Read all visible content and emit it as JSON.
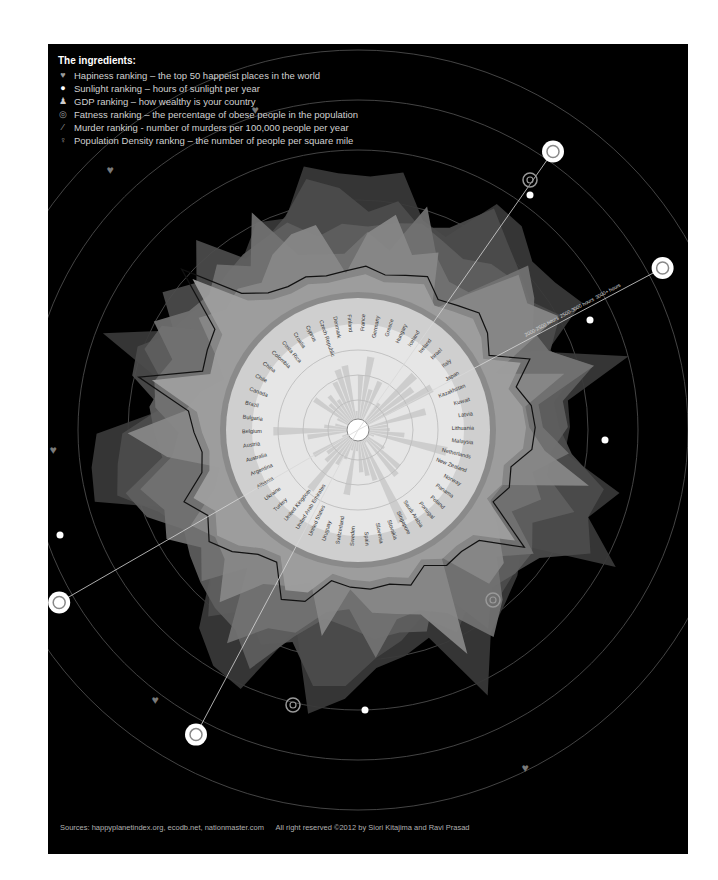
{
  "legend": {
    "title": "The ingredients:",
    "items": [
      {
        "icon": "heart-icon",
        "label": "Hapiness ranking – the top 50 happeist places in the world"
      },
      {
        "icon": "sun-icon",
        "label": "Sunlight ranking – hours of sunlight per year"
      },
      {
        "icon": "money-bag-icon",
        "label": "GDP  ranking – how wealthy is your country"
      },
      {
        "icon": "target-rings-icon",
        "label": "Fatness ranking – the percentage of obese people in the population"
      },
      {
        "icon": "knife-icon",
        "label": "Murder ranking - number of murders per 100,000 people per year"
      },
      {
        "icon": "person-icon",
        "label": "Population Density rankng – the number of people per square mile"
      }
    ]
  },
  "footer": {
    "sources": "Sources: happyplanetindex.org, ecodb.net, nationmaster.com",
    "rights": "All right reserved ©2012 by Siori Kitajima and Ravi Prasad"
  },
  "colors": {
    "background": "#000000",
    "inner_disc": "#e6e6e6",
    "label_ring": "#cfcfcf",
    "layer_light": "#9a9a9a",
    "layer_mid": "#6e6e6e",
    "layer_dark": "#3f3f3f",
    "guide_line": "#d8d8d8"
  },
  "chart_data": {
    "type": "radial",
    "title": "The ingredients",
    "categories": [
      "Canada",
      "Chile",
      "China",
      "Colombia",
      "Costa Rica",
      "Croatia",
      "Cyprus",
      "Czech Republic",
      "Denmark",
      "Finland",
      "France",
      "Germany",
      "Greece",
      "Hungary",
      "Iceland",
      "Ireland",
      "Israel",
      "Italy",
      "Japan",
      "Kazakhstan",
      "Kuwait",
      "Latvia",
      "Lithuania",
      "Malaysia",
      "Netherlands",
      "New Zealand",
      "Norway",
      "Panama",
      "Poland",
      "Portugal",
      "Saudi Arabia",
      "Singapore",
      "Slovakia",
      "Slovenia",
      "Spain",
      "Sweden",
      "Switzerland",
      "Uruguay",
      "United States",
      "United Arab Emirates",
      "United Kingdom",
      "Turkey",
      "Ukraine",
      "Albania",
      "Argentina",
      "Australia",
      "Austria",
      "Belgium",
      "Bulgaria",
      "Brazil"
    ],
    "series": [
      {
        "name": "Hapiness ranking",
        "values": [
          58,
          42,
          60,
          48,
          66,
          40,
          44,
          52,
          70,
          62,
          48,
          56,
          44,
          50,
          72,
          60,
          52,
          46,
          56,
          42,
          54,
          36,
          38,
          46,
          68,
          64,
          74,
          50,
          44,
          48,
          40,
          52,
          36,
          46,
          54,
          70,
          72,
          50,
          58,
          44,
          60,
          40,
          34,
          38,
          46,
          66,
          62,
          58,
          36,
          56
        ]
      },
      {
        "name": "Sunlight ranking",
        "values": [
          46,
          70,
          52,
          48,
          60,
          44,
          78,
          36,
          32,
          30,
          46,
          34,
          72,
          40,
          28,
          30,
          74,
          62,
          48,
          52,
          80,
          34,
          36,
          56,
          32,
          44,
          28,
          58,
          38,
          64,
          82,
          50,
          40,
          42,
          68,
          32,
          36,
          56,
          60,
          84,
          30,
          60,
          44,
          62,
          54,
          66,
          38,
          32,
          50,
          54
        ]
      },
      {
        "name": "GDP ranking",
        "values": [
          72,
          40,
          36,
          30,
          34,
          38,
          50,
          46,
          70,
          64,
          62,
          66,
          44,
          40,
          68,
          66,
          56,
          58,
          64,
          36,
          76,
          40,
          40,
          38,
          70,
          58,
          82,
          34,
          42,
          48,
          56,
          84,
          44,
          50,
          54,
          70,
          80,
          38,
          78,
          74,
          62,
          36,
          26,
          24,
          36,
          72,
          70,
          66,
          30,
          34
        ]
      },
      {
        "name": "Fatness ranking",
        "values": [
          60,
          56,
          22,
          40,
          44,
          48,
          50,
          54,
          40,
          46,
          44,
          48,
          52,
          46,
          42,
          50,
          52,
          40,
          14,
          46,
          70,
          46,
          48,
          38,
          38,
          62,
          40,
          50,
          50,
          46,
          66,
          26,
          50,
          46,
          48,
          40,
          36,
          52,
          82,
          64,
          60,
          54,
          48,
          42,
          60,
          68,
          40,
          44,
          48,
          42
        ]
      },
      {
        "name": "Murder ranking",
        "values": [
          22,
          26,
          30,
          88,
          34,
          20,
          16,
          18,
          14,
          16,
          20,
          14,
          18,
          24,
          10,
          16,
          24,
          18,
          8,
          40,
          20,
          30,
          32,
          30,
          14,
          18,
          10,
          56,
          20,
          16,
          18,
          8,
          20,
          14,
          16,
          14,
          10,
          34,
          40,
          12,
          16,
          30,
          40,
          28,
          42,
          18,
          14,
          20,
          26,
          76
        ]
      },
      {
        "name": "Population Density ranking",
        "values": [
          6,
          22,
          50,
          36,
          42,
          34,
          50,
          60,
          62,
          18,
          52,
          70,
          40,
          50,
          4,
          32,
          74,
          64,
          80,
          10,
          66,
          28,
          30,
          44,
          86,
          16,
          12,
          30,
          52,
          56,
          14,
          96,
          50,
          44,
          40,
          20,
          62,
          20,
          30,
          38,
          72,
          42,
          36,
          48,
          16,
          6,
          48,
          80,
          32,
          22
        ]
      }
    ],
    "annotations": [
      "2000-2500 hours",
      "2500-3000 hours",
      "3000+ hours"
    ],
    "layout": {
      "center": [
        358,
        430
      ],
      "inner_radius": 128,
      "ring_guides": true
    }
  }
}
